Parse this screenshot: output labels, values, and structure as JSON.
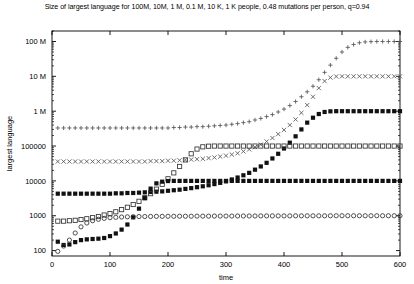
{
  "chart_data": {
    "type": "scatter",
    "title": "Size of largest language for 100M, 10M, 1 M, 0.1 M, 10 K, 1 K people, 0.48 mutations per person, q=0.94",
    "xlabel": "time",
    "ylabel": "largest language",
    "xlim": [
      0,
      600
    ],
    "ylim": [
      70,
      200000000
    ],
    "yscale": "log",
    "grid": false,
    "legend": "none",
    "xticks": [
      0,
      100,
      200,
      300,
      400,
      500,
      600
    ],
    "xtick_labels": [
      "0",
      "100",
      "200",
      "300",
      "400",
      "500",
      "600"
    ],
    "yticks": [
      100,
      1000,
      10000,
      100000,
      1000000,
      10000000,
      100000000
    ],
    "ytick_labels": [
      "100",
      "1000",
      "10000",
      "100000",
      "1 M",
      "10 M",
      "100 M"
    ],
    "series": [
      {
        "name": "100M people",
        "marker": "plus",
        "color": "#555555",
        "x": [
          10,
          20,
          30,
          40,
          50,
          60,
          70,
          80,
          90,
          100,
          110,
          120,
          130,
          140,
          150,
          160,
          170,
          180,
          190,
          200,
          210,
          220,
          230,
          240,
          250,
          260,
          270,
          280,
          290,
          300,
          310,
          320,
          330,
          340,
          350,
          360,
          370,
          380,
          390,
          400,
          410,
          420,
          430,
          440,
          450,
          460,
          470,
          480,
          490,
          500,
          510,
          520,
          530,
          540,
          550,
          560,
          570,
          580,
          590,
          600
        ],
        "y": [
          330000,
          330000,
          330000,
          330000,
          330000,
          330000,
          330000,
          330000,
          330000,
          330000,
          330000,
          330000,
          330000,
          330000,
          330000,
          330000,
          330000,
          330000,
          330000,
          330000,
          340000,
          340000,
          350000,
          350000,
          360000,
          360000,
          370000,
          380000,
          390000,
          400000,
          420000,
          440000,
          470000,
          500000,
          560000,
          620000,
          700000,
          800000,
          950000,
          1150000,
          1450000,
          1900000,
          2600000,
          3600000,
          5200000,
          8000000,
          13000000,
          21000000,
          33000000,
          50000000,
          68000000,
          82000000,
          92000000,
          97000000,
          99000000,
          100000000,
          100000000,
          100000000,
          100000000,
          100000000
        ]
      },
      {
        "name": "10M people",
        "marker": "cross",
        "color": "#555555",
        "x": [
          10,
          20,
          30,
          40,
          50,
          60,
          70,
          80,
          90,
          100,
          110,
          120,
          130,
          140,
          150,
          160,
          170,
          180,
          190,
          200,
          210,
          220,
          230,
          240,
          250,
          260,
          270,
          280,
          290,
          300,
          310,
          320,
          330,
          340,
          350,
          360,
          370,
          380,
          390,
          400,
          410,
          420,
          430,
          440,
          450,
          460,
          470,
          480,
          490,
          500,
          510,
          520,
          530,
          540,
          550,
          560,
          570,
          580,
          590,
          600
        ],
        "y": [
          36000,
          36000,
          36000,
          36000,
          36000,
          36000,
          36000,
          36000,
          36000,
          36000,
          36000,
          36000,
          36000,
          36000,
          36000,
          36000,
          37000,
          37000,
          37000,
          38000,
          38000,
          39000,
          40000,
          41000,
          42000,
          43000,
          45000,
          47000,
          50000,
          53000,
          57000,
          62000,
          70000,
          80000,
          93000,
          110000,
          135000,
          170000,
          220000,
          290000,
          400000,
          580000,
          900000,
          1500000,
          2600000,
          4600000,
          7300000,
          9200000,
          9900000,
          10000000,
          10000000,
          10000000,
          10000000,
          10000000,
          10000000,
          10000000,
          10000000,
          10000000,
          10000000,
          10000000
        ]
      },
      {
        "name": "1 M people",
        "marker": "fsquare",
        "color": "#111111",
        "x": [
          10,
          20,
          30,
          40,
          50,
          60,
          70,
          80,
          90,
          100,
          110,
          120,
          130,
          140,
          150,
          160,
          170,
          180,
          190,
          200,
          210,
          220,
          230,
          240,
          250,
          260,
          270,
          280,
          290,
          300,
          310,
          320,
          330,
          340,
          350,
          360,
          370,
          380,
          390,
          400,
          410,
          420,
          430,
          440,
          450,
          460,
          470,
          480,
          490,
          500,
          510,
          520,
          530,
          540,
          550,
          560,
          570,
          580,
          590,
          600
        ],
        "y": [
          4300,
          4300,
          4300,
          4300,
          4300,
          4300,
          4300,
          4300,
          4300,
          4300,
          4400,
          4400,
          4500,
          4500,
          4600,
          4700,
          4800,
          4900,
          5000,
          5200,
          5400,
          5600,
          5900,
          6200,
          6600,
          7000,
          7500,
          8100,
          8800,
          9700,
          11000,
          12500,
          14500,
          17000,
          21000,
          26000,
          33000,
          44000,
          60000,
          85000,
          125000,
          190000,
          300000,
          470000,
          650000,
          830000,
          950000,
          990000,
          1000000,
          1000000,
          1000000,
          1000000,
          1000000,
          1000000,
          1000000,
          1000000,
          1000000,
          1000000,
          1000000,
          1000000
        ]
      },
      {
        "name": "0.1 M people",
        "marker": "osquare",
        "color": "#333333",
        "x": [
          10,
          20,
          30,
          40,
          50,
          60,
          70,
          80,
          90,
          100,
          110,
          120,
          130,
          140,
          150,
          160,
          170,
          180,
          190,
          200,
          210,
          220,
          230,
          240,
          250,
          260,
          270,
          280,
          290,
          300,
          310,
          320,
          330,
          340,
          350,
          360,
          370,
          380,
          390,
          400,
          410,
          420,
          430,
          440,
          450,
          460,
          470,
          480,
          490,
          500,
          510,
          520,
          530,
          540,
          550,
          560,
          570,
          580,
          590,
          600
        ],
        "y": [
          700,
          700,
          720,
          740,
          780,
          820,
          880,
          950,
          1050,
          1150,
          1300,
          1500,
          1750,
          2100,
          2600,
          3300,
          4300,
          5800,
          8000,
          11500,
          17000,
          26000,
          40000,
          60000,
          82000,
          95000,
          99000,
          100000,
          100000,
          100000,
          100000,
          100000,
          100000,
          100000,
          100000,
          100000,
          100000,
          100000,
          100000,
          100000,
          100000,
          100000,
          100000,
          100000,
          100000,
          100000,
          100000,
          100000,
          100000,
          100000,
          100000,
          100000,
          100000,
          100000,
          100000,
          100000,
          100000,
          100000,
          100000,
          100000
        ]
      },
      {
        "name": "10 K people",
        "marker": "fsquare",
        "color": "#111111",
        "x": [
          10,
          20,
          30,
          40,
          50,
          60,
          70,
          80,
          90,
          100,
          110,
          120,
          130,
          140,
          150,
          160,
          170,
          180,
          190,
          200,
          210,
          220,
          230,
          240,
          250,
          260,
          270,
          280,
          290,
          300,
          310,
          320,
          330,
          340,
          350,
          360,
          370,
          380,
          390,
          400,
          410,
          420,
          430,
          440,
          450,
          460,
          470,
          480,
          490,
          500,
          510,
          520,
          530,
          540,
          550,
          560,
          570,
          580,
          590,
          600
        ],
        "y": [
          180,
          145,
          150,
          175,
          200,
          210,
          215,
          220,
          230,
          260,
          310,
          400,
          560,
          900,
          1600,
          3200,
          6000,
          8500,
          9500,
          9900,
          10000,
          10000,
          10000,
          10000,
          10000,
          10000,
          10000,
          10000,
          10000,
          10000,
          10000,
          10000,
          10000,
          10000,
          10000,
          10000,
          10000,
          10000,
          10000,
          10000,
          10000,
          10000,
          10000,
          10000,
          10000,
          10000,
          10000,
          10000,
          10000,
          10000,
          10000,
          10000,
          10000,
          10000,
          10000,
          10000,
          10000,
          10000,
          10000,
          10000
        ]
      },
      {
        "name": "1 K people",
        "marker": "ocircle",
        "color": "#333333",
        "x": [
          10,
          20,
          30,
          40,
          50,
          60,
          70,
          80,
          90,
          100,
          110,
          120,
          130,
          140,
          150,
          160,
          170,
          180,
          190,
          200,
          210,
          220,
          230,
          240,
          250,
          260,
          270,
          280,
          290,
          300,
          310,
          320,
          330,
          340,
          350,
          360,
          370,
          380,
          390,
          400,
          410,
          420,
          430,
          440,
          450,
          460,
          470,
          480,
          490,
          500,
          510,
          520,
          530,
          540,
          550,
          560,
          570,
          580,
          590,
          600
        ],
        "y": [
          95,
          135,
          200,
          320,
          480,
          620,
          720,
          790,
          840,
          880,
          900,
          920,
          930,
          940,
          950,
          950,
          955,
          960,
          960,
          965,
          965,
          970,
          970,
          970,
          975,
          975,
          975,
          980,
          980,
          980,
          980,
          985,
          985,
          985,
          985,
          990,
          990,
          990,
          990,
          990,
          990,
          995,
          995,
          995,
          995,
          995,
          995,
          1000,
          1000,
          1000,
          1000,
          1000,
          1000,
          1000,
          1000,
          1000,
          1000,
          1000,
          1000,
          1000
        ]
      }
    ]
  }
}
